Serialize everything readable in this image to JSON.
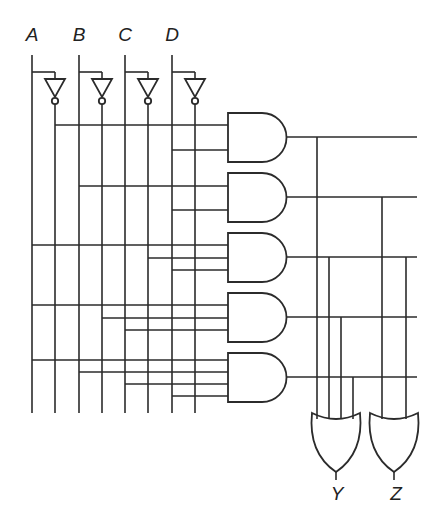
{
  "diagram": {
    "type": "combinational-logic-circuit",
    "inputs": [
      {
        "name": "A",
        "x": 32,
        "inv_x": 55
      },
      {
        "name": "B",
        "x": 79,
        "inv_x": 102
      },
      {
        "name": "C",
        "x": 125,
        "inv_x": 148
      },
      {
        "name": "D",
        "x": 172,
        "inv_x": 195
      }
    ],
    "and_gates": [
      {
        "id": "and1",
        "top": 113,
        "out_y": 137,
        "inputs": [
          {
            "src": "A'",
            "x": 55,
            "y": 125
          },
          {
            "src": "D",
            "x": 172,
            "y": 150
          }
        ]
      },
      {
        "id": "and2",
        "top": 173,
        "out_y": 197,
        "inputs": [
          {
            "src": "B",
            "x": 79,
            "y": 186
          },
          {
            "src": "D",
            "x": 172,
            "y": 210
          }
        ]
      },
      {
        "id": "and3",
        "top": 233,
        "out_y": 257,
        "inputs": [
          {
            "src": "A",
            "x": 32,
            "y": 245
          },
          {
            "src": "C'",
            "x": 148,
            "y": 258
          },
          {
            "src": "D",
            "x": 172,
            "y": 270
          }
        ]
      },
      {
        "id": "and4",
        "top": 293,
        "out_y": 317,
        "inputs": [
          {
            "src": "A",
            "x": 32,
            "y": 305
          },
          {
            "src": "B'",
            "x": 102,
            "y": 318
          },
          {
            "src": "C",
            "x": 125,
            "y": 330
          }
        ]
      },
      {
        "id": "and5",
        "top": 353,
        "out_y": 377,
        "inputs": [
          {
            "src": "A",
            "x": 32,
            "y": 360
          },
          {
            "src": "B",
            "x": 79,
            "y": 372
          },
          {
            "src": "C",
            "x": 125,
            "y": 384
          },
          {
            "src": "D",
            "x": 172,
            "y": 396
          }
        ]
      }
    ],
    "or_gates": [
      {
        "id": "orY",
        "output": "Y",
        "cx": 336,
        "left": 312,
        "right": 360,
        "taps": [
          {
            "x": 317,
            "from": "and1"
          },
          {
            "x": 329,
            "from": "and3"
          },
          {
            "x": 341,
            "from": "and4"
          },
          {
            "x": 353,
            "from": "and5"
          }
        ]
      },
      {
        "id": "orZ",
        "output": "Z",
        "cx": 394,
        "left": 370,
        "right": 418,
        "taps": [
          {
            "x": 382,
            "from": "and2"
          },
          {
            "x": 406,
            "from": "and3"
          }
        ]
      }
    ],
    "labels": {
      "A": "A",
      "B": "B",
      "C": "C",
      "D": "D",
      "Y": "Y",
      "Z": "Z"
    }
  }
}
